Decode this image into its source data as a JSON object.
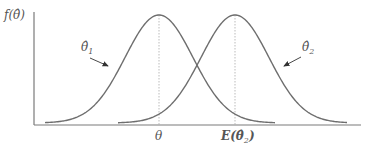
{
  "chart_data": {
    "type": "line",
    "title": "",
    "ylabel": "f(θ̂)",
    "xlabel": "",
    "x_ticks": [
      {
        "label": "θ",
        "x": 159
      },
      {
        "label": "E(θ̂₂)",
        "x": 235
      }
    ],
    "series": [
      {
        "name": "θ̂₁",
        "label_base": "θ̂",
        "label_sub": "1",
        "mean_pos": 159,
        "sd_px": 34,
        "description": "unbiased estimator density centered at θ"
      },
      {
        "name": "θ̂₂",
        "label_base": "θ̂",
        "label_sub": "2",
        "mean_pos": 235,
        "sd_px": 34,
        "description": "biased estimator density centered at E(θ̂₂)"
      }
    ],
    "grid": false,
    "legend": "annotations with arrows"
  },
  "labels": {
    "y_axis": "f(θ̂)",
    "theta": "θ",
    "expect": "E(θ̂",
    "expect_sub": "2",
    "expect_close": ")",
    "est1": "θ̂",
    "est1_sub": "1",
    "est2": "θ̂",
    "est2_sub": "2"
  },
  "colors": {
    "curve": "#6e6e6e",
    "axis": "#7a7a7a",
    "dotted": "#aaaaaa",
    "text": "#555555"
  }
}
